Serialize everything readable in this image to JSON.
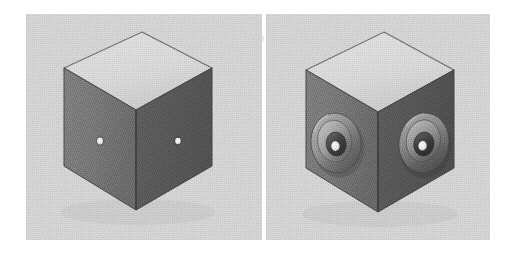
{
  "figure": {
    "kind": "scanned-halftone-figure",
    "orientation": "two-panel side-by-side",
    "ghost_text_top": "Microchannel Cube Assembly",
    "ghost_text_bottom": "manufacturing",
    "page_background": "#ffffff",
    "panel_background": "#dcdcdc",
    "panel_gap_color": "#f4f4f4"
  },
  "palette": {
    "top_face": "#e2e2e2",
    "top_face_shade": "#d6d6d6",
    "left_face": "#7c7c7c",
    "left_face_shade": "#6e6e6e",
    "right_face": "#5d5d5d",
    "right_face_shade": "#525252",
    "edge_line": "#4a4a4a",
    "silhouette_line": "#3b3b3b",
    "pinhole_white": "#fdfdfd",
    "boss_highlight": "#c8c8c8",
    "boss_midtone": "#9a9a9a",
    "boss_shadow": "#3f3f3f",
    "boss_rim_dark": "#4c4c4c"
  },
  "panels": [
    {
      "id": "panel-left",
      "name": "plain-pinhole-cube",
      "caption_label": "(a)",
      "description": "Isometric cube with a single small through-hole on each of the two visible vertical faces",
      "cube": {
        "faces": [
          "top",
          "left",
          "right"
        ],
        "apex_top_px": {
          "x": 142,
          "y": 32
        },
        "apex_bottom_px": {
          "x": 136,
          "y": 210
        },
        "left_corner_px": {
          "x": 64,
          "y": 68
        },
        "right_corner_px": {
          "x": 212,
          "y": 68
        },
        "width_px": 148,
        "height_px": 178
      },
      "features": [
        {
          "type": "pinhole",
          "face": "left",
          "cx": 100,
          "cy": 141,
          "rx": 3.0,
          "ry": 3.4
        },
        {
          "type": "pinhole",
          "face": "right",
          "cx": 178,
          "cy": 141,
          "rx": 2.8,
          "ry": 3.2
        }
      ],
      "feature_count": 2
    },
    {
      "id": "panel-right",
      "name": "counterbored-boss-cube",
      "caption_label": "(b)",
      "description": "Identical isometric cube with a raised concentric counterbore boss surrounding each through-hole",
      "cube": {
        "faces": [
          "top",
          "left",
          "right"
        ],
        "apex_top_px": {
          "x": 380,
          "y": 32
        },
        "apex_bottom_px": {
          "x": 375,
          "y": 212
        },
        "left_corner_px": {
          "x": 304,
          "y": 70
        },
        "right_corner_px": {
          "x": 452,
          "y": 70
        },
        "width_px": 148,
        "height_px": 180
      },
      "features": [
        {
          "type": "counterbore-boss",
          "face": "left",
          "cx": 333,
          "cy": 143,
          "rings": [
            {
              "name": "outer-flange",
              "rx": 25,
              "ry": 30
            },
            {
              "name": "mid-step",
              "rx": 17,
              "ry": 21
            },
            {
              "name": "inner-bore",
              "rx": 10,
              "ry": 12
            },
            {
              "name": "through-hole",
              "rx": 4.0,
              "ry": 4.6
            }
          ]
        },
        {
          "type": "counterbore-boss",
          "face": "right",
          "cx": 423,
          "cy": 143,
          "rings": [
            {
              "name": "outer-flange",
              "rx": 25,
              "ry": 30
            },
            {
              "name": "mid-step",
              "rx": 17,
              "ry": 21
            },
            {
              "name": "inner-bore",
              "rx": 10,
              "ry": 12
            },
            {
              "name": "through-hole",
              "rx": 4.0,
              "ry": 4.6
            }
          ]
        }
      ],
      "feature_count": 2
    }
  ]
}
